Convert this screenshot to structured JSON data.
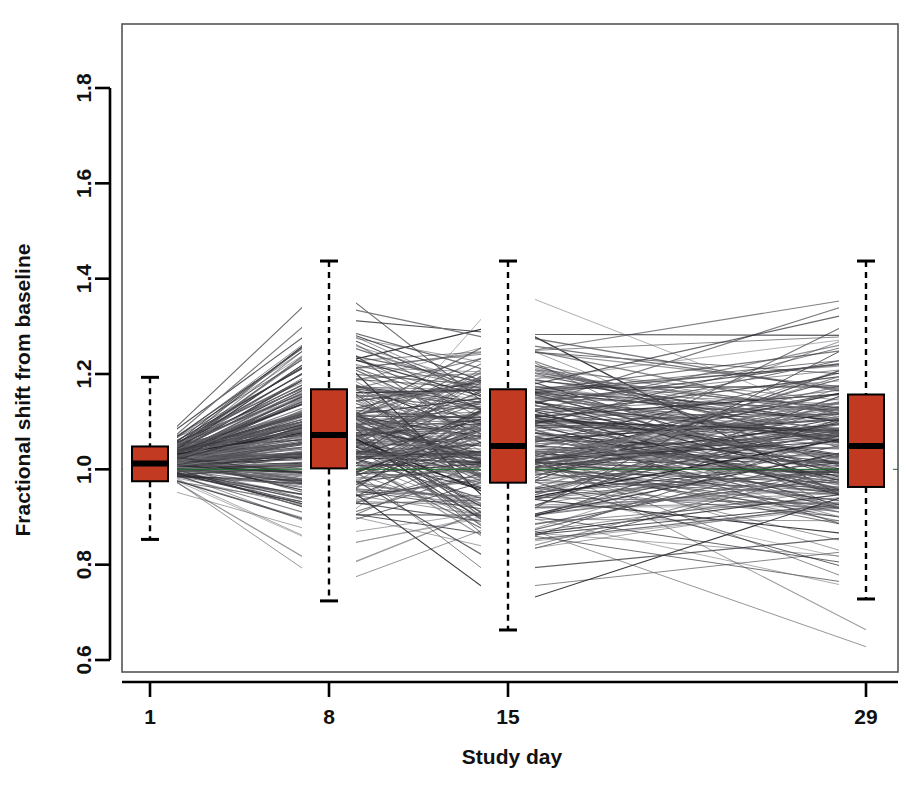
{
  "chart_data": {
    "type": "line",
    "subtype": "spaghetti-plot-with-boxplots",
    "title": "",
    "xlabel": "Study day",
    "ylabel": "Fractional shift from baseline",
    "x": [
      1,
      8,
      15,
      29
    ],
    "xtick_labels": [
      "1",
      "8",
      "15",
      "29"
    ],
    "ytick_values": [
      0.6,
      0.8,
      1.0,
      1.2,
      1.4,
      1.6,
      1.8
    ],
    "ytick_labels": [
      "0.6",
      "0.8",
      "1.0",
      "1.2",
      "1.4",
      "1.6",
      "1.8"
    ],
    "xlim": [
      -1.5,
      30.5
    ],
    "ylim": [
      0.555,
      1.9
    ],
    "grid": false,
    "legend": false,
    "reference_line": {
      "value": 1.0,
      "orientation": "horizontal",
      "color": "#1f6b27",
      "width": 1
    },
    "box_fill_color": "#c23a22",
    "box_border_color": "#000000",
    "line_color": "#2b2b33",
    "frame_color": "#555555",
    "n_subjects": 236,
    "boxplots": [
      {
        "category": "1",
        "x": 1,
        "lower_whisker": 0.853,
        "q1": 0.975,
        "median": 1.012,
        "q3": 1.048,
        "upper_whisker": 1.193
      },
      {
        "category": "8",
        "x": 8,
        "lower_whisker": 0.724,
        "q1": 1.002,
        "median": 1.072,
        "q3": 1.168,
        "upper_whisker": 1.437
      },
      {
        "category": "15",
        "x": 15,
        "lower_whisker": 0.663,
        "q1": 0.972,
        "median": 1.049,
        "q3": 1.168,
        "upper_whisker": 1.437
      },
      {
        "category": "29",
        "x": 29,
        "lower_whisker": 0.728,
        "q1": 0.963,
        "median": 1.049,
        "q3": 1.157,
        "upper_whisker": 1.437
      }
    ],
    "series_summary": {
      "description": "Individual subject trajectories of fractional shift from baseline across study days 1, 8, 15 and 29",
      "day1_range": [
        0.85,
        1.3
      ],
      "day8_range": [
        0.62,
        1.86
      ],
      "day15_range": [
        0.64,
        1.71
      ],
      "day29_range": [
        0.6,
        1.76
      ]
    }
  }
}
